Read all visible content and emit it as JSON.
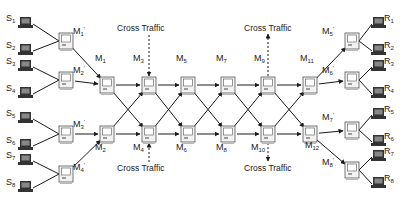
{
  "diagram": {
    "type": "network-topology",
    "senders": [
      {
        "id": "S1",
        "base": "S",
        "sub": "1",
        "x": 19,
        "y": 17,
        "lx": 6,
        "ly": 21
      },
      {
        "id": "S2",
        "base": "S",
        "sub": "2",
        "x": 19,
        "y": 44,
        "lx": 6,
        "ly": 48
      },
      {
        "id": "S3",
        "base": "S",
        "sub": "3",
        "x": 19,
        "y": 60,
        "lx": 6,
        "ly": 64
      },
      {
        "id": "S4",
        "base": "S",
        "sub": "4",
        "x": 19,
        "y": 87,
        "lx": 6,
        "ly": 91
      },
      {
        "id": "S5",
        "base": "S",
        "sub": "5",
        "x": 19,
        "y": 112,
        "lx": 6,
        "ly": 116
      },
      {
        "id": "S6",
        "base": "S",
        "sub": "6",
        "x": 19,
        "y": 139,
        "lx": 6,
        "ly": 143
      },
      {
        "id": "S7",
        "base": "S",
        "sub": "7",
        "x": 19,
        "y": 154,
        "lx": 6,
        "ly": 158
      },
      {
        "id": "S8",
        "base": "S",
        "sub": "8",
        "x": 19,
        "y": 181,
        "lx": 6,
        "ly": 185
      }
    ],
    "receivers": [
      {
        "id": "R1",
        "base": "R",
        "sub": "1",
        "x": 372,
        "y": 17,
        "lx": 384,
        "ly": 21
      },
      {
        "id": "R2",
        "base": "R",
        "sub": "2",
        "x": 372,
        "y": 44,
        "lx": 384,
        "ly": 48
      },
      {
        "id": "R3",
        "base": "R",
        "sub": "3",
        "x": 372,
        "y": 60,
        "lx": 384,
        "ly": 64
      },
      {
        "id": "R4",
        "base": "R",
        "sub": "4",
        "x": 372,
        "y": 87,
        "lx": 384,
        "ly": 91
      },
      {
        "id": "R5",
        "base": "R",
        "sub": "5",
        "x": 372,
        "y": 108,
        "lx": 384,
        "ly": 112
      },
      {
        "id": "R6",
        "base": "R",
        "sub": "6",
        "x": 372,
        "y": 135,
        "lx": 384,
        "ly": 139
      },
      {
        "id": "R7",
        "base": "R",
        "sub": "7",
        "x": 372,
        "y": 150,
        "lx": 384,
        "ly": 154
      },
      {
        "id": "R8",
        "base": "R",
        "sub": "8",
        "x": 372,
        "y": 177,
        "lx": 384,
        "ly": 181
      }
    ],
    "routers": [
      {
        "id": "M1'",
        "base": "M",
        "sub": "1",
        "prime": "'",
        "x": 59,
        "y": 33,
        "lx": 73,
        "ly": 34
      },
      {
        "id": "M2'",
        "base": "M",
        "sub": "2",
        "prime": "'",
        "x": 59,
        "y": 72,
        "lx": 73,
        "ly": 73
      },
      {
        "id": "M3'",
        "base": "M",
        "sub": "3",
        "prime": "'",
        "x": 59,
        "y": 126,
        "lx": 73,
        "ly": 127
      },
      {
        "id": "M4'",
        "base": "M",
        "sub": "4",
        "prime": "'",
        "x": 59,
        "y": 166,
        "lx": 73,
        "ly": 170
      },
      {
        "id": "M1",
        "base": "M",
        "sub": "1",
        "prime": "",
        "x": 100,
        "y": 77,
        "lx": 95,
        "ly": 61
      },
      {
        "id": "M2",
        "base": "M",
        "sub": "2",
        "prime": "",
        "x": 100,
        "y": 126,
        "lx": 95,
        "ly": 150
      },
      {
        "id": "M3",
        "base": "M",
        "sub": "3",
        "prime": "",
        "x": 142,
        "y": 77,
        "lx": 133,
        "ly": 61
      },
      {
        "id": "M4",
        "base": "M",
        "sub": "4",
        "prime": "",
        "x": 142,
        "y": 126,
        "lx": 133,
        "ly": 150
      },
      {
        "id": "M5",
        "base": "M",
        "sub": "5",
        "prime": "",
        "x": 181,
        "y": 77,
        "lx": 176,
        "ly": 61
      },
      {
        "id": "M6",
        "base": "M",
        "sub": "6",
        "prime": "",
        "x": 181,
        "y": 126,
        "lx": 176,
        "ly": 150
      },
      {
        "id": "M7",
        "base": "M",
        "sub": "7",
        "prime": "",
        "x": 221,
        "y": 77,
        "lx": 216,
        "ly": 61
      },
      {
        "id": "M8",
        "base": "M",
        "sub": "8",
        "prime": "",
        "x": 221,
        "y": 126,
        "lx": 216,
        "ly": 150
      },
      {
        "id": "M9",
        "base": "M",
        "sub": "9",
        "prime": "",
        "x": 261,
        "y": 77,
        "lx": 254,
        "ly": 61
      },
      {
        "id": "M10",
        "base": "M",
        "sub": "10",
        "prime": "",
        "x": 261,
        "y": 126,
        "lx": 251,
        "ly": 150
      },
      {
        "id": "M11",
        "base": "M",
        "sub": "11",
        "prime": "",
        "x": 303,
        "y": 77,
        "lx": 300,
        "ly": 61
      },
      {
        "id": "M12",
        "base": "M",
        "sub": "12",
        "prime": "",
        "x": 303,
        "y": 126,
        "lx": 305,
        "ly": 148
      },
      {
        "id": "M5'",
        "base": "M",
        "sub": "5",
        "prime": "'",
        "x": 345,
        "y": 33,
        "lx": 322,
        "ly": 34
      },
      {
        "id": "M6'",
        "base": "M",
        "sub": "6",
        "prime": "'",
        "x": 345,
        "y": 72,
        "lx": 322,
        "ly": 73
      },
      {
        "id": "M7'",
        "base": "M",
        "sub": "7",
        "prime": "'",
        "x": 345,
        "y": 122,
        "lx": 322,
        "ly": 120
      },
      {
        "id": "M8'",
        "base": "M",
        "sub": "8",
        "prime": "'",
        "x": 345,
        "y": 162,
        "lx": 322,
        "ly": 165
      }
    ],
    "cross_traffic": [
      {
        "label": "Cross Traffic",
        "lx": 117,
        "ly": 31,
        "direction": "in",
        "attached_to": "M3"
      },
      {
        "label": "Cross Traffic",
        "lx": 117,
        "ly": 171,
        "direction": "in",
        "attached_to": "M4"
      },
      {
        "label": "Cross Traffic",
        "lx": 244,
        "ly": 31,
        "direction": "out",
        "attached_to": "M9"
      },
      {
        "label": "Cross Traffic",
        "lx": 244,
        "ly": 171,
        "direction": "out",
        "attached_to": "M10"
      }
    ],
    "links": [
      [
        "M1'",
        "M1"
      ],
      [
        "M2'",
        "M1"
      ],
      [
        "M3'",
        "M2"
      ],
      [
        "M4'",
        "M2"
      ],
      [
        "M1",
        "M3"
      ],
      [
        "M1",
        "M4"
      ],
      [
        "M2",
        "M3"
      ],
      [
        "M2",
        "M4"
      ],
      [
        "M3",
        "M5"
      ],
      [
        "M3",
        "M6"
      ],
      [
        "M4",
        "M5"
      ],
      [
        "M4",
        "M6"
      ],
      [
        "M5",
        "M7"
      ],
      [
        "M5",
        "M8"
      ],
      [
        "M6",
        "M7"
      ],
      [
        "M6",
        "M8"
      ],
      [
        "M7",
        "M9"
      ],
      [
        "M7",
        "M10"
      ],
      [
        "M8",
        "M9"
      ],
      [
        "M8",
        "M10"
      ],
      [
        "M9",
        "M11"
      ],
      [
        "M9",
        "M12"
      ],
      [
        "M10",
        "M11"
      ],
      [
        "M10",
        "M12"
      ],
      [
        "M11",
        "M5'"
      ],
      [
        "M11",
        "M6'"
      ],
      [
        "M12",
        "M7'"
      ],
      [
        "M12",
        "M8'"
      ]
    ]
  },
  "colors": {
    "line": "#1a1a1a",
    "node_border": "#555555",
    "node_fill": "#f2f2f2",
    "laptop": "#333333",
    "background": "#ffffff"
  }
}
